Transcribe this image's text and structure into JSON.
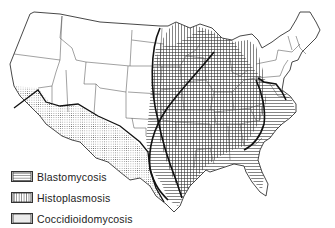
{
  "map": {
    "subject": "United States endemic regions of systemic fungal infections",
    "regions": [
      {
        "id": "blastomycosis",
        "pattern": "horizontal-lines"
      },
      {
        "id": "histoplasmosis",
        "pattern": "vertical-lines"
      },
      {
        "id": "coccidioidomycosis",
        "pattern": "dots"
      }
    ]
  },
  "legend": {
    "items": [
      {
        "label": "Blastomycosis",
        "pattern": "horizontal-lines"
      },
      {
        "label": "Histoplasmosis",
        "pattern": "vertical-lines"
      },
      {
        "label": "Coccidioidomycosis",
        "pattern": "dots"
      }
    ]
  },
  "colors": {
    "ink": "#222222",
    "background": "#ffffff"
  }
}
